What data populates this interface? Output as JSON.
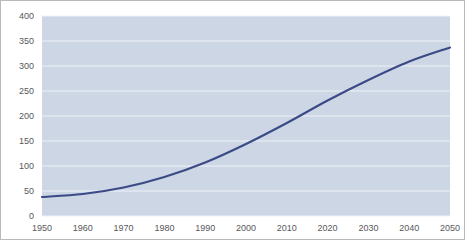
{
  "chart_data": {
    "type": "line",
    "title": "",
    "subtitle": "",
    "xlabel": "",
    "ylabel": "",
    "x": [
      1950,
      1960,
      1970,
      1980,
      1990,
      2000,
      2010,
      2020,
      2030,
      2040,
      2050
    ],
    "xtick_labels": [
      "1950",
      "1960",
      "1970",
      "1980",
      "1990",
      "2000",
      "2010",
      "2020",
      "2030",
      "2040",
      "2050"
    ],
    "series": [
      {
        "name": "Population",
        "values": [
          38,
          44,
          57,
          78,
          107,
          144,
          186,
          231,
          272,
          309,
          337
        ]
      }
    ],
    "ytick_labels": [
      "0",
      "50",
      "100",
      "150",
      "200",
      "250",
      "300",
      "350",
      "400"
    ],
    "yticks": [
      0,
      50,
      100,
      150,
      200,
      250,
      300,
      350,
      400
    ],
    "ylim": [
      0,
      400
    ],
    "xlim": [
      1950,
      2050
    ],
    "grid": true,
    "grid_axis": "y",
    "legend": false,
    "legend_position": "none",
    "annotations": []
  },
  "style": {
    "plot_background": "#ccd6e4",
    "grid_color": "#eef2f7",
    "line_color": "#3b4a87",
    "tick_label_color": "#58585a",
    "frame_border_color": "#b9b9b9",
    "page_background": "#ffffff"
  },
  "geometry": {
    "plot_left": 41,
    "plot_right": 449,
    "plot_top": 15,
    "plot_bottom": 215
  }
}
